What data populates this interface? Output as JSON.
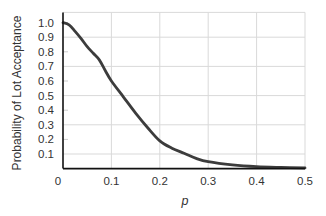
{
  "chart_data": {
    "type": "line",
    "title": "",
    "xlabel": "p",
    "ylabel": "Probability of Lot Acceptance",
    "xlim": [
      0,
      0.5
    ],
    "ylim": [
      0,
      1.07
    ],
    "grid": true,
    "legend": null,
    "x_ticks": [
      "0",
      "0.1",
      "0.2",
      "0.3",
      "0.4",
      "0.5"
    ],
    "x_tick_values": [
      0,
      0.1,
      0.2,
      0.3,
      0.4,
      0.5
    ],
    "y_ticks": [
      "0.1",
      "0.2",
      "0.3",
      "0.4",
      "0.5",
      "0.6",
      "0.7",
      "0.8",
      "0.9",
      "1.0"
    ],
    "y_tick_values": [
      0.1,
      0.2,
      0.3,
      0.4,
      0.5,
      0.6,
      0.7,
      0.8,
      0.9,
      1.0
    ],
    "y_gridlines": [
      0.1,
      0.3,
      0.5,
      0.7,
      0.9
    ],
    "x_gridlines": [
      0.1,
      0.2,
      0.3,
      0.4,
      0.5
    ],
    "series": [
      {
        "name": "OC curve",
        "color": "#3c3c3c",
        "x": [
          0,
          0.0125,
          0.025,
          0.0375,
          0.05,
          0.0625,
          0.075,
          0.0875,
          0.1,
          0.125,
          0.15,
          0.175,
          0.2,
          0.225,
          0.25,
          0.275,
          0.3,
          0.35,
          0.4,
          0.45,
          0.5
        ],
        "y": [
          1.0,
          0.985,
          0.94,
          0.89,
          0.835,
          0.79,
          0.745,
          0.67,
          0.6,
          0.49,
          0.38,
          0.28,
          0.19,
          0.14,
          0.105,
          0.07,
          0.047,
          0.025,
          0.013,
          0.008,
          0.005
        ]
      }
    ]
  },
  "colors": {
    "axis": "#111111",
    "grid": "#d9d9d9",
    "curve": "#3c3c3c",
    "text": "#333333"
  }
}
